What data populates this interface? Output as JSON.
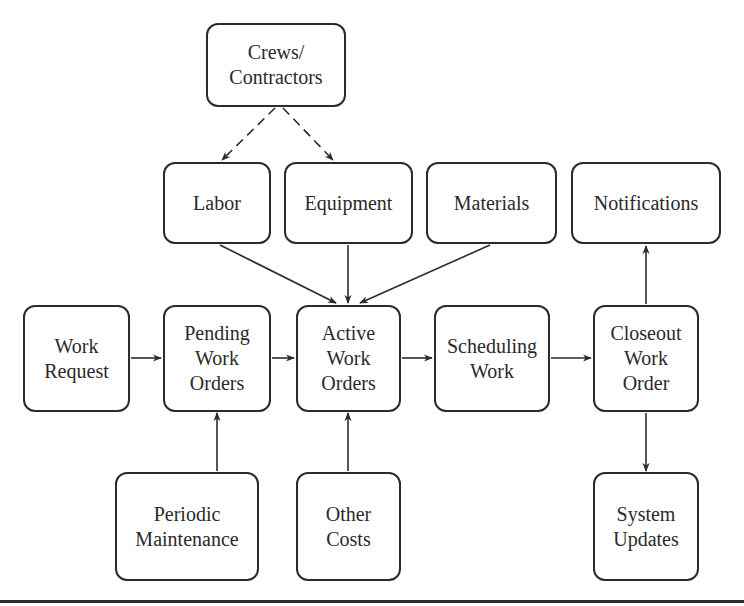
{
  "diagram": {
    "type": "flowchart",
    "nodes": [
      {
        "id": "crews",
        "label": "Crews/\nContractors",
        "x": 206,
        "y": 23,
        "w": 140,
        "h": 84
      },
      {
        "id": "labor",
        "label": "Labor",
        "x": 163,
        "y": 162,
        "w": 108,
        "h": 82
      },
      {
        "id": "equipment",
        "label": "Equipment",
        "x": 284,
        "y": 162,
        "w": 129,
        "h": 82
      },
      {
        "id": "materials",
        "label": "Materials",
        "x": 426,
        "y": 162,
        "w": 131,
        "h": 82
      },
      {
        "id": "notifications",
        "label": "Notifications",
        "x": 571,
        "y": 162,
        "w": 150,
        "h": 82
      },
      {
        "id": "work_request",
        "label": "Work\nRequest",
        "x": 23,
        "y": 305,
        "w": 107,
        "h": 107
      },
      {
        "id": "pending",
        "label": "Pending\nWork\nOrders",
        "x": 163,
        "y": 305,
        "w": 108,
        "h": 107
      },
      {
        "id": "active",
        "label": "Active\nWork\nOrders",
        "x": 296,
        "y": 305,
        "w": 105,
        "h": 107
      },
      {
        "id": "scheduling",
        "label": "Scheduling\nWork",
        "x": 434,
        "y": 305,
        "w": 116,
        "h": 107
      },
      {
        "id": "closeout",
        "label": "Closeout\nWork\nOrder",
        "x": 593,
        "y": 305,
        "w": 106,
        "h": 107
      },
      {
        "id": "periodic",
        "label": "Periodic\nMaintenance",
        "x": 115,
        "y": 472,
        "w": 144,
        "h": 109
      },
      {
        "id": "other_costs",
        "label": "Other\nCosts",
        "x": 296,
        "y": 472,
        "w": 105,
        "h": 109
      },
      {
        "id": "system_updates",
        "label": "System\nUpdates",
        "x": 593,
        "y": 472,
        "w": 106,
        "h": 109
      }
    ],
    "edges": [
      {
        "from": "crews",
        "to": "labor",
        "style": "dashed",
        "x1": 275,
        "y1": 108,
        "x2": 222,
        "y2": 160
      },
      {
        "from": "crews",
        "to": "equipment",
        "style": "dashed",
        "x1": 283,
        "y1": 108,
        "x2": 333,
        "y2": 160
      },
      {
        "from": "labor",
        "to": "active",
        "style": "solid",
        "x1": 220,
        "y1": 245,
        "x2": 336,
        "y2": 303
      },
      {
        "from": "equipment",
        "to": "active",
        "style": "solid",
        "x1": 348,
        "y1": 245,
        "x2": 348,
        "y2": 303
      },
      {
        "from": "materials",
        "to": "active",
        "style": "solid",
        "x1": 490,
        "y1": 245,
        "x2": 360,
        "y2": 303
      },
      {
        "from": "work_request",
        "to": "pending",
        "style": "solid",
        "x1": 131,
        "y1": 358,
        "x2": 161,
        "y2": 358
      },
      {
        "from": "pending",
        "to": "active",
        "style": "solid",
        "x1": 272,
        "y1": 358,
        "x2": 294,
        "y2": 358
      },
      {
        "from": "active",
        "to": "scheduling",
        "style": "solid",
        "x1": 402,
        "y1": 358,
        "x2": 432,
        "y2": 358
      },
      {
        "from": "scheduling",
        "to": "closeout",
        "style": "solid",
        "x1": 551,
        "y1": 358,
        "x2": 591,
        "y2": 358
      },
      {
        "from": "periodic",
        "to": "pending",
        "style": "solid",
        "x1": 217,
        "y1": 471,
        "x2": 217,
        "y2": 413
      },
      {
        "from": "other_costs",
        "to": "active",
        "style": "solid",
        "x1": 348,
        "y1": 471,
        "x2": 348,
        "y2": 413
      },
      {
        "from": "closeout",
        "to": "notifications",
        "style": "solid",
        "x1": 646,
        "y1": 304,
        "x2": 646,
        "y2": 246
      },
      {
        "from": "closeout",
        "to": "system_updates",
        "style": "solid",
        "x1": 646,
        "y1": 413,
        "x2": 646,
        "y2": 471
      }
    ]
  },
  "colors": {
    "stroke": "#2b2b2b",
    "text": "#2a2a2a",
    "background": "#ffffff"
  }
}
